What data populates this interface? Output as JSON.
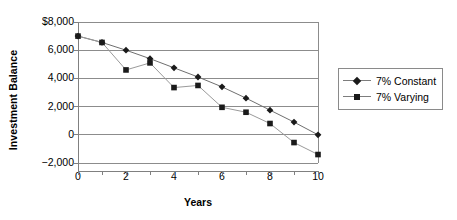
{
  "chart_data": {
    "type": "line",
    "title": "",
    "xlabel": "Years",
    "ylabel": "Investment Balance",
    "x": [
      0,
      1,
      2,
      3,
      4,
      5,
      6,
      7,
      8,
      9,
      10
    ],
    "xlim": [
      0,
      10
    ],
    "ylim": [
      -2000,
      8000
    ],
    "xticks": [
      0,
      1,
      2,
      3,
      4,
      5,
      6,
      7,
      8,
      9,
      10
    ],
    "xticklabels": [
      "0",
      "",
      "2",
      "",
      "4",
      "",
      "6",
      "",
      "8",
      "",
      "10"
    ],
    "yticks": [
      -2000,
      0,
      2000,
      4000,
      6000,
      8000
    ],
    "yticklabels": [
      "−2,000",
      "0",
      "2,000",
      "4,000",
      "6,000",
      "$8,000"
    ],
    "grid": "horizontal",
    "legend_position": "right",
    "series": [
      {
        "name": "7% Constant",
        "marker": "diamond",
        "color": "#1a1a1a",
        "line_color": "#6f6f6f",
        "values": [
          7000,
          6550,
          6000,
          5400,
          4750,
          4100,
          3400,
          2600,
          1750,
          900,
          0
        ]
      },
      {
        "name": "7% Varying",
        "marker": "square",
        "color": "#1a1a1a",
        "line_color": "#9a9a9a",
        "values": [
          7000,
          6550,
          4600,
          5100,
          3350,
          3500,
          1950,
          1600,
          800,
          -550,
          -1400
        ]
      }
    ]
  },
  "axis": {
    "y_title": "Investment Balance",
    "x_title": "Years"
  },
  "legend": {
    "entries": [
      {
        "label": "7% Constant",
        "marker": "diamond-marker"
      },
      {
        "label": "7% Varying",
        "marker": "square-marker"
      }
    ]
  },
  "colors": {
    "axis": "#808080",
    "grid": "#8c8c8c",
    "marker": "#1a1a1a",
    "series1_line": "#6f6f6f",
    "series2_line": "#9a9a9a",
    "background": "#ffffff"
  }
}
